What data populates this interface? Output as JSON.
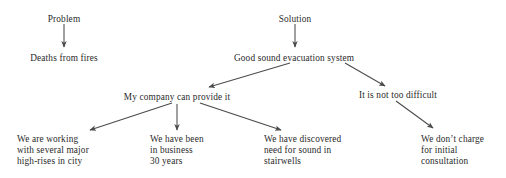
{
  "diagram": {
    "type": "tree",
    "title_text_color": "#2a2a2a",
    "background_color": "#ffffff",
    "edge_color": "#4a4a4a",
    "nodes": [
      {
        "id": "problem",
        "label": "Problem",
        "x": 64,
        "y": 14,
        "align": "centered"
      },
      {
        "id": "deaths",
        "label": "Deaths from fires",
        "x": 64,
        "y": 53,
        "align": "centered"
      },
      {
        "id": "solution",
        "label": "Solution",
        "x": 295,
        "y": 14,
        "align": "centered"
      },
      {
        "id": "goodsystem",
        "label": "Good sound evacuation system",
        "x": 294,
        "y": 53,
        "align": "centered"
      },
      {
        "id": "mycompany",
        "label": "My company can provide it",
        "x": 177,
        "y": 92,
        "align": "centered"
      },
      {
        "id": "notdifficult",
        "label": "It is not too difficult",
        "x": 398,
        "y": 90,
        "align": "centered"
      },
      {
        "id": "working",
        "label": "We are working\nwith several major\nhigh-rises in city",
        "x": 17,
        "y": 134,
        "align": "lefted"
      },
      {
        "id": "business",
        "label": "We have been\nin business\n30 years",
        "x": 150,
        "y": 134,
        "align": "lefted"
      },
      {
        "id": "discovered",
        "label": "We have discovered\nneed for sound in\nstairwells",
        "x": 264,
        "y": 134,
        "align": "lefted"
      },
      {
        "id": "nocharge",
        "label": "We don’t charge\nfor initial\nconsultation",
        "x": 421,
        "y": 134,
        "align": "lefted"
      }
    ],
    "edges": [
      {
        "id": "problem-to-deaths",
        "from": "problem",
        "to": "deaths",
        "x1": 64,
        "y1": 24,
        "x2": 64,
        "y2": 47
      },
      {
        "id": "solution-to-goodsystem",
        "from": "solution",
        "to": "goodsystem",
        "x1": 295,
        "y1": 24,
        "x2": 295,
        "y2": 47
      },
      {
        "id": "goodsystem-to-mycompany",
        "from": "goodsystem",
        "to": "mycompany",
        "x1": 290,
        "y1": 63,
        "x2": 209,
        "y2": 87
      },
      {
        "id": "goodsystem-to-notdifficult",
        "from": "goodsystem",
        "to": "notdifficult",
        "x1": 345,
        "y1": 63,
        "x2": 385,
        "y2": 86
      },
      {
        "id": "mycompany-to-working",
        "from": "mycompany",
        "to": "working",
        "x1": 172,
        "y1": 103,
        "x2": 90,
        "y2": 130
      },
      {
        "id": "mycompany-to-business",
        "from": "mycompany",
        "to": "business",
        "x1": 177,
        "y1": 104,
        "x2": 177,
        "y2": 130
      },
      {
        "id": "mycompany-to-discovered",
        "from": "mycompany",
        "to": "discovered",
        "x1": 200,
        "y1": 103,
        "x2": 281,
        "y2": 130
      },
      {
        "id": "notdifficult-to-nocharge",
        "from": "notdifficult",
        "to": "nocharge",
        "x1": 396,
        "y1": 101,
        "x2": 433,
        "y2": 128
      }
    ]
  }
}
